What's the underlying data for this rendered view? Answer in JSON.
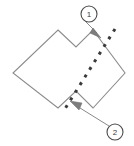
{
  "figure": {
    "background_color": "#ffffff",
    "outline_color": "#8c8c8c",
    "dashed_color": "#3a3a3a",
    "arrow_color": "#6b6b6b",
    "callout_circle_color": "#4a4a4a",
    "shape": {
      "name": "notched-hexagon-polygon",
      "points": "58,30 76,47 93,30 125,73 93,108 76,91 58,108 13,73"
    },
    "dashed_line": {
      "name": "cut-line",
      "x1": 115,
      "y1": 29,
      "x2": 63,
      "y2": 112,
      "dash_pattern": "3 6",
      "width": 3
    },
    "callouts": [
      {
        "id": "1",
        "label": "1",
        "circle": {
          "cx": 89,
          "cy": 14,
          "r": 8
        },
        "leader": {
          "x1": 86,
          "y1": 22,
          "x2": 96,
          "y2": 32
        },
        "arrow_tip": {
          "x": 100,
          "y": 37
        }
      },
      {
        "id": "2",
        "label": "2",
        "circle": {
          "cx": 115,
          "cy": 132,
          "r": 8
        },
        "leader": {
          "x1": 109,
          "y1": 126,
          "x2": 79,
          "y2": 108
        },
        "arrow_tip": {
          "x": 71,
          "y": 102
        }
      }
    ]
  }
}
